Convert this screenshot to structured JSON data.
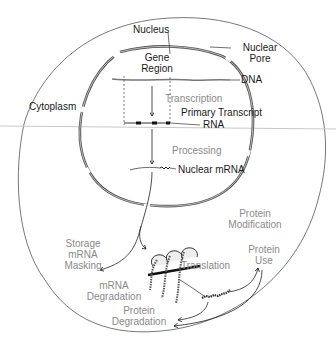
{
  "diagram": {
    "colors": {
      "cell_membrane": "#555555",
      "nuclear_envelope": "#666666",
      "nuclear_pore_shading": "#aaaaaa",
      "dark_label": "#1a1a1a",
      "process_label": "#8a8a8a",
      "scan_line": "#c8c8c8"
    },
    "structure_labels": {
      "nucleus": "Nucleus",
      "nuclear_pore_1": "Nuclear",
      "nuclear_pore_2": "Pore",
      "gene_region_1": "Gene",
      "gene_region_2": "Region",
      "dna": "DNA",
      "cytoplasm": "Cytoplasm",
      "primary_transcript": "Primary Transcript",
      "rna": "RNA",
      "nuclear_mrna": "Nuclear mRNA"
    },
    "process_labels": {
      "transcription": "Transcription",
      "processing": "Processing",
      "storage_1": "Storage",
      "storage_2": "mRNA",
      "storage_3": "Masking",
      "mrna_degradation_1": "mRNA",
      "mrna_degradation_2": "Degradation",
      "translation": "Translation",
      "protein_modification_1": "Protein",
      "protein_modification_2": "Modification",
      "protein_use_1": "Protein",
      "protein_use_2": "Use",
      "protein_degradation_1": "Protein",
      "protein_degradation_2": "Degradation"
    },
    "flow": [
      "Gene Region (DNA)",
      "Transcription",
      "Primary Transcript RNA",
      "Processing",
      "Nuclear mRNA",
      "Storage / mRNA Masking",
      "Translation",
      "Protein Modification",
      "Protein Use",
      "Protein Degradation"
    ]
  }
}
